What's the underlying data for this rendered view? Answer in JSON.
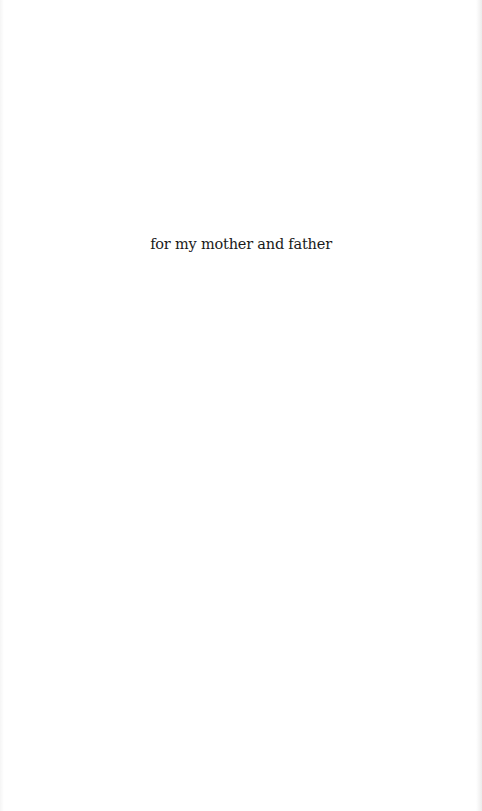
{
  "page": {
    "dedication": "for my mother and father",
    "colors": {
      "background": "#ffffff",
      "text": "#1a1a1a"
    }
  }
}
